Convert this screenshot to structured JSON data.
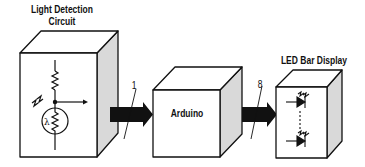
{
  "diagram": {
    "blocks": [
      {
        "id": "light",
        "label_line1": "Light Detection",
        "label_line2": "Circuit",
        "content": "resistor and photoresistor (λ) voltage divider with output arrow"
      },
      {
        "id": "arduino",
        "label": "Arduino"
      },
      {
        "id": "led",
        "label": "LED Bar Display",
        "content": "two LEDs with dashed continuation"
      }
    ],
    "connections": [
      {
        "from": "light",
        "to": "arduino",
        "bus_width": "1"
      },
      {
        "from": "arduino",
        "to": "led",
        "bus_width": "8"
      }
    ],
    "symbols": {
      "photoresistor": "λ"
    },
    "colors": {
      "line": "#111111",
      "side_face": "#d9d9d9",
      "face": "#ffffff",
      "arrow": "#111111"
    }
  }
}
